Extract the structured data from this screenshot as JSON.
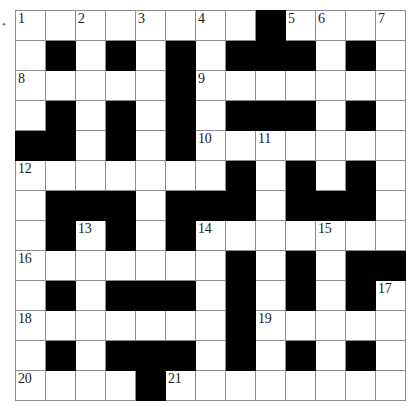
{
  "puzzle": {
    "title": "Crossword Grid",
    "kind": "crossword",
    "rows": 13,
    "cols": 13,
    "colors": {
      "block": "#000000",
      "cell": "#ffffff",
      "inner_border": "#8d8d8d",
      "outer_border": "#3a3a3a",
      "number_text": "#1a1a1a"
    },
    "edge_mark": "•",
    "grid": [
      [
        {
          "block": false,
          "number": "1"
        },
        {
          "block": false,
          "number": ""
        },
        {
          "block": false,
          "number": "2"
        },
        {
          "block": false,
          "number": ""
        },
        {
          "block": false,
          "number": "3"
        },
        {
          "block": false,
          "number": ""
        },
        {
          "block": false,
          "number": "4"
        },
        {
          "block": false,
          "number": ""
        },
        {
          "block": true,
          "number": ""
        },
        {
          "block": false,
          "number": "5"
        },
        {
          "block": false,
          "number": "6"
        },
        {
          "block": false,
          "number": ""
        },
        {
          "block": false,
          "number": "7"
        }
      ],
      [
        {
          "block": false,
          "number": ""
        },
        {
          "block": true,
          "number": ""
        },
        {
          "block": false,
          "number": ""
        },
        {
          "block": true,
          "number": ""
        },
        {
          "block": false,
          "number": ""
        },
        {
          "block": true,
          "number": ""
        },
        {
          "block": false,
          "number": ""
        },
        {
          "block": true,
          "number": ""
        },
        {
          "block": true,
          "number": ""
        },
        {
          "block": true,
          "number": ""
        },
        {
          "block": false,
          "number": ""
        },
        {
          "block": true,
          "number": ""
        },
        {
          "block": false,
          "number": ""
        }
      ],
      [
        {
          "block": false,
          "number": "8"
        },
        {
          "block": false,
          "number": ""
        },
        {
          "block": false,
          "number": ""
        },
        {
          "block": false,
          "number": ""
        },
        {
          "block": false,
          "number": ""
        },
        {
          "block": true,
          "number": ""
        },
        {
          "block": false,
          "number": "9"
        },
        {
          "block": false,
          "number": ""
        },
        {
          "block": false,
          "number": ""
        },
        {
          "block": false,
          "number": ""
        },
        {
          "block": false,
          "number": ""
        },
        {
          "block": false,
          "number": ""
        },
        {
          "block": false,
          "number": ""
        }
      ],
      [
        {
          "block": false,
          "number": ""
        },
        {
          "block": true,
          "number": ""
        },
        {
          "block": false,
          "number": ""
        },
        {
          "block": true,
          "number": ""
        },
        {
          "block": false,
          "number": ""
        },
        {
          "block": true,
          "number": ""
        },
        {
          "block": false,
          "number": ""
        },
        {
          "block": true,
          "number": ""
        },
        {
          "block": true,
          "number": ""
        },
        {
          "block": true,
          "number": ""
        },
        {
          "block": false,
          "number": ""
        },
        {
          "block": true,
          "number": ""
        },
        {
          "block": false,
          "number": ""
        }
      ],
      [
        {
          "block": true,
          "number": ""
        },
        {
          "block": true,
          "number": ""
        },
        {
          "block": false,
          "number": ""
        },
        {
          "block": true,
          "number": ""
        },
        {
          "block": false,
          "number": ""
        },
        {
          "block": true,
          "number": ""
        },
        {
          "block": false,
          "number": "10"
        },
        {
          "block": false,
          "number": ""
        },
        {
          "block": false,
          "number": "11"
        },
        {
          "block": false,
          "number": ""
        },
        {
          "block": false,
          "number": ""
        },
        {
          "block": false,
          "number": ""
        },
        {
          "block": false,
          "number": ""
        }
      ],
      [
        {
          "block": false,
          "number": "12"
        },
        {
          "block": false,
          "number": ""
        },
        {
          "block": false,
          "number": ""
        },
        {
          "block": false,
          "number": ""
        },
        {
          "block": false,
          "number": ""
        },
        {
          "block": false,
          "number": ""
        },
        {
          "block": false,
          "number": ""
        },
        {
          "block": true,
          "number": ""
        },
        {
          "block": false,
          "number": ""
        },
        {
          "block": true,
          "number": ""
        },
        {
          "block": false,
          "number": ""
        },
        {
          "block": true,
          "number": ""
        },
        {
          "block": false,
          "number": ""
        }
      ],
      [
        {
          "block": false,
          "number": ""
        },
        {
          "block": true,
          "number": ""
        },
        {
          "block": true,
          "number": ""
        },
        {
          "block": true,
          "number": ""
        },
        {
          "block": false,
          "number": ""
        },
        {
          "block": true,
          "number": ""
        },
        {
          "block": true,
          "number": ""
        },
        {
          "block": true,
          "number": ""
        },
        {
          "block": false,
          "number": ""
        },
        {
          "block": true,
          "number": ""
        },
        {
          "block": true,
          "number": ""
        },
        {
          "block": true,
          "number": ""
        },
        {
          "block": false,
          "number": ""
        }
      ],
      [
        {
          "block": false,
          "number": ""
        },
        {
          "block": true,
          "number": ""
        },
        {
          "block": false,
          "number": "13"
        },
        {
          "block": true,
          "number": ""
        },
        {
          "block": false,
          "number": ""
        },
        {
          "block": true,
          "number": ""
        },
        {
          "block": false,
          "number": "14"
        },
        {
          "block": false,
          "number": ""
        },
        {
          "block": false,
          "number": ""
        },
        {
          "block": false,
          "number": ""
        },
        {
          "block": false,
          "number": "15"
        },
        {
          "block": false,
          "number": ""
        },
        {
          "block": false,
          "number": ""
        }
      ],
      [
        {
          "block": false,
          "number": "16"
        },
        {
          "block": false,
          "number": ""
        },
        {
          "block": false,
          "number": ""
        },
        {
          "block": false,
          "number": ""
        },
        {
          "block": false,
          "number": ""
        },
        {
          "block": false,
          "number": ""
        },
        {
          "block": false,
          "number": ""
        },
        {
          "block": true,
          "number": ""
        },
        {
          "block": false,
          "number": ""
        },
        {
          "block": true,
          "number": ""
        },
        {
          "block": false,
          "number": ""
        },
        {
          "block": true,
          "number": ""
        },
        {
          "block": true,
          "number": ""
        }
      ],
      [
        {
          "block": false,
          "number": ""
        },
        {
          "block": true,
          "number": ""
        },
        {
          "block": false,
          "number": ""
        },
        {
          "block": true,
          "number": ""
        },
        {
          "block": true,
          "number": ""
        },
        {
          "block": true,
          "number": ""
        },
        {
          "block": false,
          "number": ""
        },
        {
          "block": true,
          "number": ""
        },
        {
          "block": false,
          "number": ""
        },
        {
          "block": true,
          "number": ""
        },
        {
          "block": false,
          "number": ""
        },
        {
          "block": true,
          "number": ""
        },
        {
          "block": false,
          "number": "17"
        }
      ],
      [
        {
          "block": false,
          "number": "18"
        },
        {
          "block": false,
          "number": ""
        },
        {
          "block": false,
          "number": ""
        },
        {
          "block": false,
          "number": ""
        },
        {
          "block": false,
          "number": ""
        },
        {
          "block": false,
          "number": ""
        },
        {
          "block": false,
          "number": ""
        },
        {
          "block": true,
          "number": ""
        },
        {
          "block": false,
          "number": "19"
        },
        {
          "block": false,
          "number": ""
        },
        {
          "block": false,
          "number": ""
        },
        {
          "block": false,
          "number": ""
        },
        {
          "block": false,
          "number": ""
        }
      ],
      [
        {
          "block": false,
          "number": ""
        },
        {
          "block": true,
          "number": ""
        },
        {
          "block": false,
          "number": ""
        },
        {
          "block": true,
          "number": ""
        },
        {
          "block": true,
          "number": ""
        },
        {
          "block": true,
          "number": ""
        },
        {
          "block": false,
          "number": ""
        },
        {
          "block": true,
          "number": ""
        },
        {
          "block": false,
          "number": ""
        },
        {
          "block": true,
          "number": ""
        },
        {
          "block": false,
          "number": ""
        },
        {
          "block": true,
          "number": ""
        },
        {
          "block": false,
          "number": ""
        }
      ],
      [
        {
          "block": false,
          "number": "20"
        },
        {
          "block": false,
          "number": ""
        },
        {
          "block": false,
          "number": ""
        },
        {
          "block": false,
          "number": ""
        },
        {
          "block": true,
          "number": ""
        },
        {
          "block": false,
          "number": "21"
        },
        {
          "block": false,
          "number": ""
        },
        {
          "block": false,
          "number": ""
        },
        {
          "block": false,
          "number": ""
        },
        {
          "block": false,
          "number": ""
        },
        {
          "block": false,
          "number": ""
        },
        {
          "block": false,
          "number": ""
        },
        {
          "block": false,
          "number": ""
        }
      ]
    ]
  }
}
